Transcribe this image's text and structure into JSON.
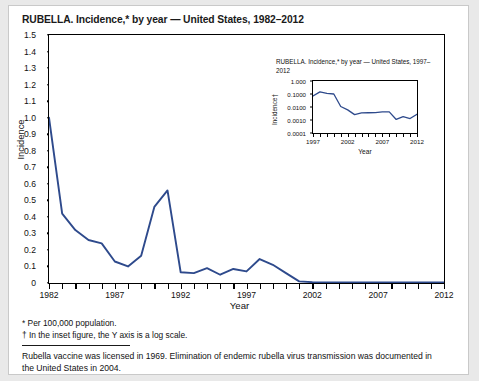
{
  "figure": {
    "title": "RUBELLA. Incidence,* by year — United States, 1982–2012"
  },
  "footnotes": {
    "star": "* Per 100,000 population.",
    "dagger": "† In the inset figure, the Y axis is a log scale.",
    "note": "Rubella vaccine was licensed in 1969. Elimination of endemic rubella virus transmission was documented in the United States in 2004."
  },
  "chart_data": [
    {
      "id": "main",
      "type": "line",
      "title": "RUBELLA. Incidence,* by year — United States, 1982–2012",
      "xlabel": "Year",
      "ylabel": "Incidence",
      "xlim": [
        1982,
        2012
      ],
      "ylim": [
        0,
        1.5
      ],
      "yscale": "linear",
      "grid": false,
      "legend": "none",
      "line_color": "#2e4a8c",
      "ytick_labels": [
        "1.5",
        "1.4",
        "1.3",
        "1.2",
        "1.1",
        "1.0",
        "0.9",
        "0.8",
        "0.7",
        "0.6",
        "0.5",
        "0.4",
        "0.3",
        "0.2",
        "0.1",
        "0"
      ],
      "ytick_values": [
        1.5,
        1.4,
        1.3,
        1.2,
        1.1,
        1.0,
        0.9,
        0.8,
        0.7,
        0.6,
        0.5,
        0.4,
        0.3,
        0.2,
        0.1,
        0
      ],
      "xtick_labels": [
        "1982",
        "1987",
        "1992",
        "1997",
        "2002",
        "2007",
        "2012"
      ],
      "xtick_values": [
        1982,
        1987,
        1992,
        1997,
        2002,
        2007,
        2012
      ],
      "x": [
        1982,
        1983,
        1984,
        1985,
        1986,
        1987,
        1988,
        1989,
        1990,
        1991,
        1992,
        1993,
        1994,
        1995,
        1996,
        1997,
        1998,
        1999,
        2000,
        2001,
        2002,
        2003,
        2004,
        2005,
        2006,
        2007,
        2008,
        2009,
        2010,
        2011,
        2012
      ],
      "values": [
        1.0,
        0.42,
        0.32,
        0.26,
        0.24,
        0.13,
        0.1,
        0.165,
        0.46,
        0.56,
        0.065,
        0.06,
        0.09,
        0.05,
        0.085,
        0.07,
        0.145,
        0.11,
        0.06,
        0.01,
        0.005,
        0.004,
        0.004,
        0.004,
        0.004,
        0.004,
        0.004,
        0.003,
        0.003,
        0.003,
        0.004
      ]
    },
    {
      "id": "inset",
      "type": "line",
      "title": "RUBELLA. Incidence,* by year — United States, 1997–2012",
      "xlabel": "Year",
      "ylabel": "Incidence†",
      "xlim": [
        1997,
        2012
      ],
      "ylim": [
        0.0001,
        1.0
      ],
      "yscale": "log",
      "grid": false,
      "legend": "none",
      "line_color": "#2e4a8c",
      "ytick_labels": [
        "1.000",
        "0.1000",
        "0.0100",
        "0.0010",
        "0.0001"
      ],
      "ytick_values": [
        1.0,
        0.1,
        0.01,
        0.001,
        0.0001
      ],
      "xtick_labels": [
        "1997",
        "2002",
        "2007",
        "2012"
      ],
      "xtick_values": [
        1997,
        2002,
        2007,
        2012
      ],
      "x": [
        1997,
        1998,
        1999,
        2000,
        2001,
        2002,
        2003,
        2004,
        2005,
        2006,
        2007,
        2008,
        2009,
        2010,
        2011,
        2012
      ],
      "values": [
        0.07,
        0.145,
        0.11,
        0.1,
        0.011,
        0.006,
        0.0026,
        0.0035,
        0.0036,
        0.0037,
        0.0042,
        0.0042,
        0.0011,
        0.0018,
        0.0013,
        0.0028
      ]
    }
  ]
}
